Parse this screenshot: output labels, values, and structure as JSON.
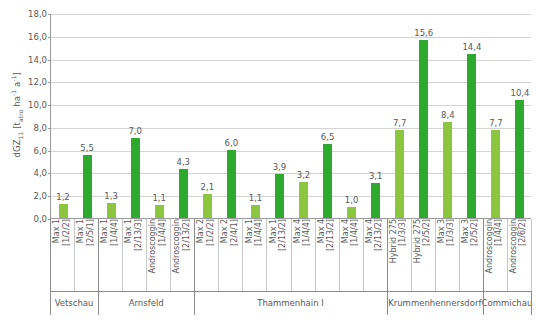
{
  "chart_data": {
    "type": "bar",
    "title": "",
    "xlabel": "",
    "ylabel": "dGZ11 [tatro ha-1 a-1]",
    "ylabel_parts": {
      "base": "dGZ",
      "sub": "11",
      "unit_open": " [t",
      "unit_sub": "atro",
      "unit_mid": " ha",
      "unit_sup1": "-1",
      "unit_mid2": " a",
      "unit_sup2": "-1",
      "unit_close": "]"
    },
    "ylim": [
      0,
      18
    ],
    "ytick_step": 2,
    "yticks": [
      "0,0",
      "2,0",
      "4,0",
      "6,0",
      "8,0",
      "10,0",
      "12,0",
      "14,0",
      "16,0",
      "18,0"
    ],
    "grid": true,
    "legend": "none",
    "values": [
      1.2,
      5.5,
      1.3,
      7.0,
      1.1,
      4.3,
      2.1,
      6.0,
      1.1,
      3.9,
      3.2,
      6.5,
      1.0,
      3.1,
      7.7,
      15.6,
      8.4,
      14.4,
      7.7,
      10.4
    ],
    "value_labels": [
      "1,2",
      "5,5",
      "1,3",
      "7,0",
      "1,1",
      "4,3",
      "2,1",
      "6,0",
      "1,1",
      "3,9",
      "3,2",
      "6,5",
      "1,0",
      "3,1",
      "7,7",
      "15,6",
      "8,4",
      "14,4",
      "7,7",
      "10,4"
    ],
    "colors": [
      "#8CC63E",
      "#2DAA2D",
      "#8CC63E",
      "#2DAA2D",
      "#8CC63E",
      "#2DAA2D",
      "#8CC63E",
      "#2DAA2D",
      "#8CC63E",
      "#2DAA2D",
      "#8CC63E",
      "#2DAA2D",
      "#8CC63E",
      "#2DAA2D",
      "#8CC63E",
      "#2DAA2D",
      "#8CC63E",
      "#2DAA2D",
      "#8CC63E",
      "#2DAA2D"
    ],
    "categories": [
      {
        "name": "Max 1",
        "code": "[1/2/2]"
      },
      {
        "name": "Max 1",
        "code": "[2/5/1]"
      },
      {
        "name": "Max 1",
        "code": "[1/4/4]"
      },
      {
        "name": "Max 1",
        "code": "[2/13/3]"
      },
      {
        "name": "Androscoggin",
        "code": "[1/4/4]"
      },
      {
        "name": "Androscoggin",
        "code": "[2/13/2]"
      },
      {
        "name": "Max 2",
        "code": "[1/2/2]"
      },
      {
        "name": "Max 2",
        "code": "[2/4/1]"
      },
      {
        "name": "Max 1",
        "code": "[1/4/4]"
      },
      {
        "name": "Max 1",
        "code": "[2/13/2]"
      },
      {
        "name": "Max 4",
        "code": "[1/4/4]"
      },
      {
        "name": "Max 4",
        "code": "[2/13/2]"
      },
      {
        "name": "Max 4",
        "code": "[1/4/4]"
      },
      {
        "name": "Max 4",
        "code": "[2/13/2]"
      },
      {
        "name": "Hybrid 275",
        "code": "[1/3/3]"
      },
      {
        "name": "Hybrid 275",
        "code": "[2/5/2]"
      },
      {
        "name": "Max 3",
        "code": "[1/3/3]"
      },
      {
        "name": "Max 3",
        "code": "[2/5/2]"
      },
      {
        "name": "Androscoggin",
        "code": "[1/4/4]"
      },
      {
        "name": "Androscoggin",
        "code": "[2/6/2]"
      }
    ],
    "groups": [
      {
        "label": "Vetschau",
        "count": 2
      },
      {
        "label": "Arnsfeld",
        "count": 4
      },
      {
        "label": "Thammenhain I",
        "count": 8
      },
      {
        "label": "Krummenhennersdorf",
        "count": 4
      },
      {
        "label": "Commichau",
        "count": 2
      }
    ],
    "colors_meta": {
      "light_green": "#8CC63E",
      "dark_green": "#2DAA2D",
      "grid": "#d4d4d4",
      "axis": "#9a9a9a",
      "text": "#595959"
    }
  }
}
